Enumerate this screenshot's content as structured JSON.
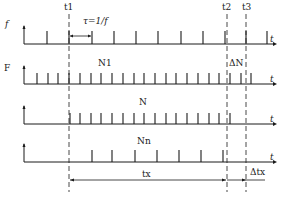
{
  "diagram": {
    "colors": {
      "ink": "#1a1a1a",
      "background": "#ffffff"
    },
    "markers": [
      {
        "id": "t1",
        "label": "t1",
        "x": 69
      },
      {
        "id": "t2",
        "label": "t2",
        "x": 227
      },
      {
        "id": "t3",
        "label": "t3",
        "x": 246
      }
    ],
    "rows": [
      {
        "id": "reference-signal",
        "y_axis_label": "f",
        "x_axis_label": "t",
        "axis_y": 44,
        "ticks": [
          47,
          69,
          92,
          114,
          136,
          158,
          181,
          203,
          225,
          246,
          267
        ],
        "annotation": "τ=1/f"
      },
      {
        "id": "standard-clock",
        "y_axis_label": "F",
        "x_axis_label": "t",
        "axis_y": 84,
        "ticks": [
          37,
          48,
          58,
          69,
          80,
          91,
          101,
          112,
          123,
          134,
          144,
          155,
          166,
          176,
          187,
          198,
          209,
          219,
          230,
          241,
          251
        ],
        "count_label": "N1",
        "delta_label": "ΔN"
      },
      {
        "id": "gated-count",
        "y_axis_label": "",
        "x_axis_label": "t",
        "axis_y": 124,
        "ticks": [
          70,
          80,
          91,
          101,
          112,
          123,
          134,
          144,
          155,
          166,
          176,
          187,
          198,
          209,
          219,
          230
        ],
        "count_label": "N"
      },
      {
        "id": "measured-signal",
        "y_axis_label": "",
        "x_axis_label": "t",
        "axis_y": 162,
        "ticks": [
          92,
          112,
          135,
          157,
          179,
          201,
          223
        ],
        "count_label": "Nn"
      }
    ],
    "intervals": {
      "tx_label": "tx",
      "delta_tx_label": "Δtx"
    }
  }
}
